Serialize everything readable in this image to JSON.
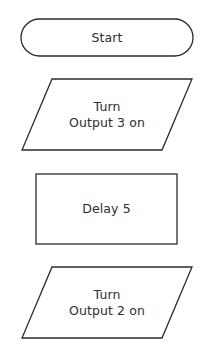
{
  "diagram": {
    "type": "flowchart",
    "colors": {
      "stroke": "#2b2b2b",
      "fill": "#ffffff",
      "text": "#2e2e2e"
    },
    "nodes": [
      {
        "id": "start",
        "shape": "terminal",
        "lines": [
          "Start"
        ]
      },
      {
        "id": "output3",
        "shape": "parallelogram",
        "lines": [
          "Turn",
          "Output 3 on"
        ]
      },
      {
        "id": "delay",
        "shape": "rectangle",
        "lines": [
          "Delay 5"
        ]
      },
      {
        "id": "output2",
        "shape": "parallelogram",
        "lines": [
          "Turn",
          "Output 2 on"
        ]
      }
    ]
  }
}
